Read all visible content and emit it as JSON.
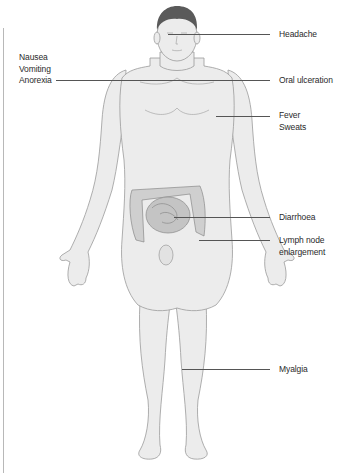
{
  "diagram": {
    "type": "anatomical-symptom-map",
    "colors": {
      "skin": "#ececec",
      "outline": "#9a9a9a",
      "hair": "#5a5a5a",
      "intestine": "#cfcfcf",
      "leader_line": "#555555",
      "text": "#2a2a2a"
    },
    "labels_left": [
      {
        "id": "nausea",
        "text": "Nausea\nVomiting\nAnorexia"
      }
    ],
    "labels_right": [
      {
        "id": "headache",
        "text": "Headache"
      },
      {
        "id": "oral-ulceration",
        "text": "Oral ulceration"
      },
      {
        "id": "fever",
        "text": "Fever\nSweats"
      },
      {
        "id": "diarrhoea",
        "text": "Diarrhoea"
      },
      {
        "id": "lymph-node",
        "text": "Lymph node\nenlargement"
      },
      {
        "id": "myalgia",
        "text": "Myalgia"
      }
    ]
  }
}
